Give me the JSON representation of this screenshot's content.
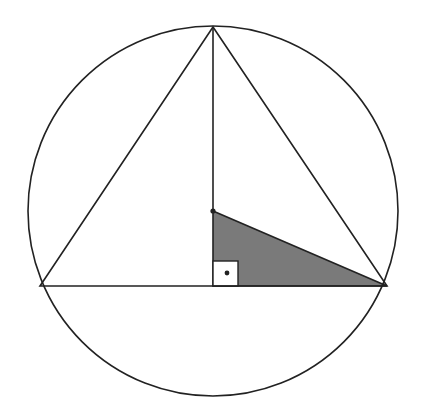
{
  "diagram": {
    "colors": {
      "line": "#222222",
      "shaded_region": "#7a7a7a",
      "background": "#ffffff"
    },
    "elements": [
      "circumscribed-circle",
      "equilateral-triangle",
      "altitude-segment",
      "center-point",
      "shaded-right-triangle",
      "right-angle-marker"
    ]
  }
}
